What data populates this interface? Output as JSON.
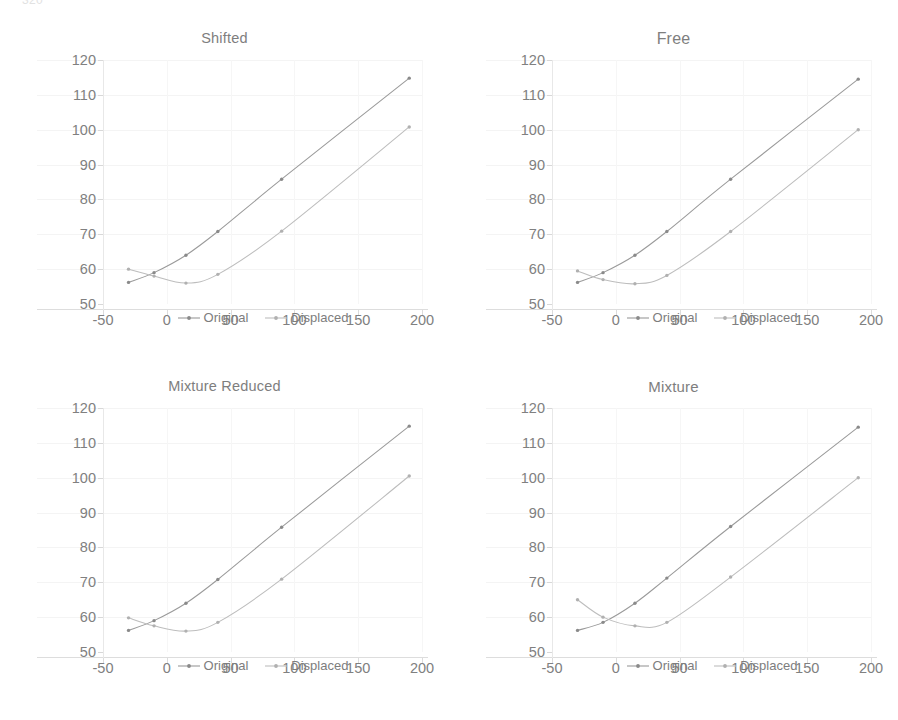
{
  "page": {
    "top_remnant_left": "320",
    "top_remnant_mid": "",
    "top_remnant_right": ""
  },
  "colors": {
    "original_line": "#9a9a9a",
    "displaced_line": "#bdbdbd",
    "original_marker": "#8a8a8a",
    "displaced_marker": "#b0b0b0",
    "axis": "#dddddd",
    "gridline": "#f4f4f4",
    "text": "#7e7e7e",
    "background": "#ffffff"
  },
  "legend": {
    "original_label": "Original",
    "displaced_label": "Displaced"
  },
  "axes": {
    "y_ticks": [
      50,
      60,
      70,
      80,
      90,
      100,
      110,
      120
    ],
    "x_ticks": [
      -50,
      0,
      50,
      100,
      150,
      200
    ],
    "ylim": [
      50,
      120
    ],
    "xlim": [
      -50,
      200
    ]
  },
  "chart_data": [
    {
      "type": "line",
      "title": "Shifted",
      "xlabel": "",
      "ylabel": "",
      "xlim": [
        -50,
        200
      ],
      "ylim": [
        50,
        120
      ],
      "grid": true,
      "legend_position": "bottom",
      "x": [
        -30,
        -10,
        15,
        40,
        90,
        190
      ],
      "series": [
        {
          "name": "Original",
          "values": [
            56.2,
            59.0,
            64.0,
            70.8,
            85.8,
            114.8
          ]
        },
        {
          "name": "Displaced",
          "values": [
            60.0,
            58.0,
            56.0,
            58.5,
            70.9,
            100.8
          ]
        }
      ]
    },
    {
      "type": "line",
      "title": "Free",
      "xlabel": "",
      "ylabel": "",
      "xlim": [
        -50,
        200
      ],
      "ylim": [
        50,
        120
      ],
      "grid": true,
      "legend_position": "bottom",
      "x": [
        -30,
        -10,
        15,
        40,
        90,
        190
      ],
      "series": [
        {
          "name": "Original",
          "values": [
            56.2,
            59.0,
            64.0,
            70.8,
            85.8,
            114.5
          ]
        },
        {
          "name": "Displaced",
          "values": [
            59.5,
            57.0,
            55.8,
            58.2,
            70.8,
            100.0
          ]
        }
      ]
    },
    {
      "type": "line",
      "title": "Mixture Reduced",
      "xlabel": "",
      "ylabel": "",
      "xlim": [
        -50,
        200
      ],
      "ylim": [
        50,
        120
      ],
      "grid": true,
      "legend_position": "bottom",
      "x": [
        -30,
        -10,
        15,
        40,
        90,
        190
      ],
      "series": [
        {
          "name": "Original",
          "values": [
            56.2,
            59.0,
            64.0,
            70.8,
            85.8,
            114.8
          ]
        },
        {
          "name": "Displaced",
          "values": [
            59.8,
            57.5,
            56.0,
            58.5,
            70.9,
            100.5
          ]
        }
      ]
    },
    {
      "type": "line",
      "title": "Mixture",
      "xlabel": "",
      "ylabel": "",
      "xlim": [
        -50,
        200
      ],
      "ylim": [
        50,
        120
      ],
      "grid": true,
      "legend_position": "bottom",
      "x": [
        -30,
        -10,
        15,
        40,
        90,
        190
      ],
      "series": [
        {
          "name": "Original",
          "values": [
            56.2,
            58.5,
            64.0,
            71.2,
            86.0,
            114.5
          ]
        },
        {
          "name": "Displaced",
          "values": [
            65.0,
            60.0,
            57.5,
            58.5,
            71.5,
            100.0
          ]
        }
      ]
    }
  ]
}
